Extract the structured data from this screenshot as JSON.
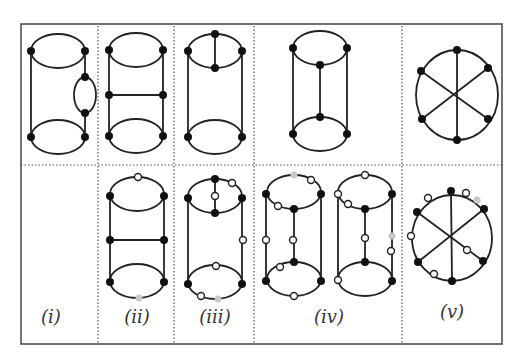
{
  "figure": {
    "panels": [
      {
        "id": "i",
        "label": "(i)",
        "label_x": 51,
        "label_y": 316
      },
      {
        "id": "ii",
        "label": "(ii)",
        "label_x": 137,
        "label_y": 316
      },
      {
        "id": "iii",
        "label": "(iii)",
        "label_x": 215,
        "label_y": 316
      },
      {
        "id": "iv",
        "label": "(iv)",
        "label_x": 329,
        "label_y": 316
      },
      {
        "id": "v",
        "label": "(v)",
        "label_x": 452,
        "label_y": 312
      }
    ],
    "node_colors": {
      "filled": "#111111",
      "open": "#ffffff",
      "gray": "#c8c8c8"
    },
    "line_color": "#222222"
  }
}
